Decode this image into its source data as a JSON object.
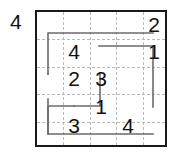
{
  "puzzle": {
    "type": "loop-path-grid-puzzle",
    "grid": {
      "columns": 5,
      "rows": 5,
      "cell_width": 26.4,
      "cell_height": 27.4,
      "border_color": "#1a1a1a",
      "gridline_color": "#b9b9b9",
      "gridline_style": "dashed",
      "background": "#ffffff"
    },
    "outside_clues": [
      {
        "label": "4",
        "position": "top-left-outside",
        "x": 10,
        "y": 10
      }
    ],
    "cells": [
      {
        "value": "2",
        "row": 1,
        "col": 5
      },
      {
        "value": "1",
        "row": 2,
        "col": 5
      },
      {
        "value": "4",
        "row": 2,
        "col": 2
      },
      {
        "value": "2",
        "row": 3,
        "col": 2
      },
      {
        "value": "3",
        "row": 3,
        "col": 3
      },
      {
        "value": "1",
        "row": 4,
        "col": 3
      },
      {
        "value": "3",
        "row": 5,
        "col": 2
      },
      {
        "value": "4",
        "row": 5,
        "col": 4
      }
    ],
    "path": {
      "stroke_color": "#6b6b6b",
      "stroke_width": 1.6,
      "description": "single snaking polyline connecting clue cells",
      "points": [
        [
          14,
          97
        ],
        [
          14,
          124
        ],
        [
          119,
          124
        ],
        [
          119,
          37
        ],
        [
          92,
          37
        ],
        [
          92,
          97
        ],
        [
          40,
          97
        ],
        [
          40,
          60
        ],
        [
          66,
          60
        ],
        [
          66,
          97
        ],
        [
          14,
          97
        ]
      ],
      "segments": [
        {
          "from": [
            119,
            24
          ],
          "to": [
            14,
            24
          ]
        },
        {
          "from": [
            14,
            24
          ],
          "to": [
            14,
            64
          ]
        },
        {
          "from": [
            66,
            37
          ],
          "to": [
            119,
            37
          ]
        },
        {
          "from": [
            119,
            37
          ],
          "to": [
            119,
            97
          ]
        },
        {
          "from": [
            66,
            64
          ],
          "to": [
            66,
            97
          ]
        },
        {
          "from": [
            40,
            97
          ],
          "to": [
            66,
            97
          ]
        },
        {
          "from": [
            40,
            97
          ],
          "to": [
            40,
            124
          ]
        },
        {
          "from": [
            14,
            124
          ],
          "to": [
            119,
            124
          ]
        }
      ]
    }
  }
}
